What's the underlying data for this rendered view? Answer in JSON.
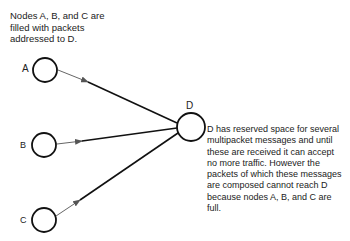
{
  "caption_top": [
    "Nodes A, B, and C are",
    "filled with packets",
    "addressed to D."
  ],
  "nodes": {
    "A": "A",
    "B": "B",
    "C": "C",
    "D": "D"
  },
  "caption_right": [
    "D has reserved space for several",
    "multipacket messages and until",
    "these are received it can accept",
    "no more traffic. However  the",
    "packets of which these messages",
    "are composed cannot reach D",
    "because nodes A, B, and C are",
    "full."
  ]
}
